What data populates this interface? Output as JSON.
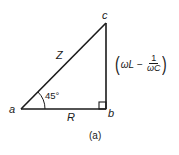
{
  "diagram": {
    "type": "impedance-triangle",
    "vertices": {
      "a": {
        "label": "a",
        "x": 21,
        "y": 109
      },
      "b": {
        "label": "b",
        "x": 106,
        "y": 109
      },
      "c": {
        "label": "c",
        "x": 106,
        "y": 23
      }
    },
    "sides": {
      "hypotenuse": {
        "label": "Z",
        "from": "a",
        "to": "c"
      },
      "base": {
        "label": "R",
        "from": "a",
        "to": "b"
      },
      "vertical": {
        "from": "b",
        "to": "c",
        "expression": {
          "open_paren": "(",
          "term": "ωL",
          "operator": "−",
          "fraction_numerator": "1",
          "fraction_denominator": "ωC",
          "close_paren": ")"
        }
      }
    },
    "angle": {
      "vertex": "a",
      "label": "45°"
    },
    "right_angle_marker": {
      "vertex": "b"
    },
    "caption": "(a)",
    "line_color": "#1a1a1a"
  }
}
